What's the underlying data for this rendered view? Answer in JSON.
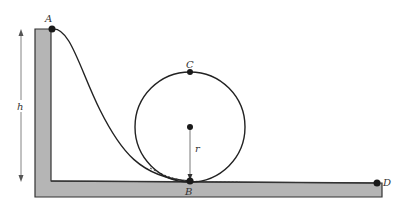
{
  "diagram": {
    "labels": {
      "A": "A",
      "B": "B",
      "C": "C",
      "D": "D",
      "height": "h",
      "radius": "r"
    },
    "colors": {
      "platform_fill": "#b5b5b5",
      "outline": "#333333",
      "point": "#1a1a1a",
      "arrow": "#555555"
    },
    "points": [
      {
        "name": "A",
        "desc": "start at top of ramp"
      },
      {
        "name": "B",
        "desc": "bottom of loop"
      },
      {
        "name": "C",
        "desc": "top of loop"
      },
      {
        "name": "D",
        "desc": "end of track"
      }
    ]
  }
}
